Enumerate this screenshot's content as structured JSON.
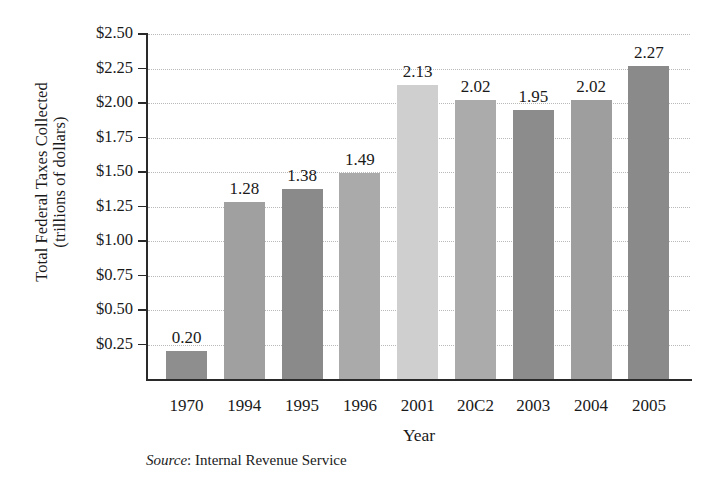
{
  "chart_data": {
    "type": "bar",
    "title": "",
    "subtitle": "",
    "xlabel": "Year",
    "ylabel": "Total Federal Taxes Collected (trillions of dollars)",
    "ylabel_lines": [
      "Total Federal Taxes Collected",
      "(trillions of dollars)"
    ],
    "categories": [
      "1970",
      "1994",
      "1995",
      "1996",
      "2001",
      "20C2",
      "2003",
      "2004",
      "2005"
    ],
    "categories_actual": [
      "1970",
      "1994",
      "1995",
      "1996",
      "2001",
      "2002",
      "2003",
      "2004",
      "2005"
    ],
    "values": [
      0.2,
      1.28,
      1.38,
      1.49,
      2.13,
      2.02,
      1.95,
      2.02,
      2.27
    ],
    "value_labels": [
      "0.20",
      "1.28",
      "1.38",
      "1.49",
      "2.13",
      "2.02",
      "1.95",
      "2.02",
      "2.27"
    ],
    "bar_colors": [
      "#8e8e8e",
      "#a0a0a0",
      "#8a8a8a",
      "#aaaaaa",
      "#cfcfcf",
      "#ababab",
      "#8c8c8c",
      "#9e9e9e",
      "#8a8a8a"
    ],
    "ylim": [
      0,
      2.5
    ],
    "ytick_values": [
      2.5,
      2.25,
      2.0,
      1.75,
      1.5,
      1.25,
      1.0,
      0.75,
      0.5,
      0.25
    ],
    "ytick_labels": [
      "$2.50",
      "$2.25",
      "$2.00",
      "$1.75",
      "$1.50",
      "$1.25",
      "$1.00",
      "$0.75",
      "$0.50",
      "$0.25"
    ],
    "grid": true,
    "grid_style": "dotted",
    "legend": "none",
    "units": "trillions of dollars"
  },
  "source_note": {
    "label": "Source",
    "separator": ": ",
    "text": "Internal Revenue Service"
  }
}
